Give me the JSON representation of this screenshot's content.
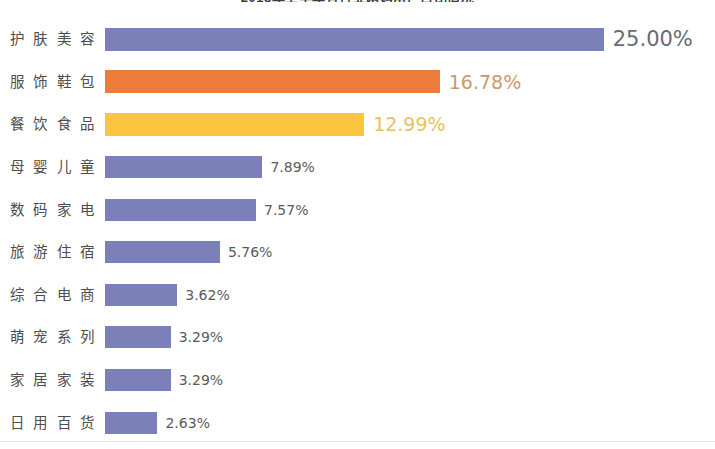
{
  "chart": {
    "title": "2018年上半年各行业网购用户占比情况"
  },
  "chart_data": {
    "type": "bar",
    "orientation": "horizontal",
    "title": "2018年上半年各行业网购用户占比情况",
    "xlabel": "",
    "ylabel": "",
    "xlim": [
      0,
      25
    ],
    "grid": false,
    "legend": "none",
    "value_suffix": "%",
    "categories": [
      "护肤美容",
      "服饰鞋包",
      "餐饮食品",
      "母婴儿童",
      "数码家电",
      "旅游住宿",
      "综合电商",
      "萌宠系列",
      "家居家装",
      "日用百货"
    ],
    "values": [
      25.0,
      16.78,
      12.99,
      7.89,
      7.57,
      5.76,
      3.62,
      3.29,
      3.29,
      2.63
    ],
    "value_labels": [
      "25.00%",
      "16.78%",
      "12.99%",
      "7.89%",
      "7.57%",
      "5.76%",
      "3.62%",
      "3.29%",
      "3.29%",
      "2.63%"
    ],
    "bar_colors": [
      "#7b80b8",
      "#ec7b3c",
      "#fbc košt",
      "#7b80b8",
      "#7b80b8",
      "#7b80b8",
      "#7b80b8",
      "#7b80b8",
      "#7b80b8",
      "#7b80b8"
    ],
    "label_colors": [
      "#6a6a72",
      "#c99a72",
      "#e8c463",
      "#5a5a5a",
      "#5a5a5a",
      "#5a5a5a",
      "#5a5a5a",
      "#5a5a5a",
      "#5a5a5a",
      "#5a5a5a"
    ]
  },
  "colors": {
    "purple": "#7b80b8",
    "orange": "#ec7b3c",
    "yellow": "#fbc53f",
    "text": "#4d4d4d"
  }
}
